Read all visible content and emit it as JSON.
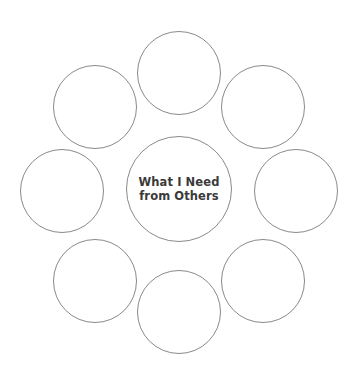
{
  "diagram": {
    "type": "cluster-web",
    "background_color": "#ffffff",
    "stroke_color": "#8a8a8a",
    "stroke_width_px": 1,
    "canvas": {
      "width": 355,
      "height": 376
    },
    "center": {
      "label": "What I Need\nfrom Others",
      "label_line_1": "What I Need",
      "label_line_2": "from Others",
      "text_color": "#3a3a3a",
      "cx": 179,
      "cy": 189,
      "diameter": 106
    },
    "petals": [
      {
        "name": "petal-top",
        "label": "",
        "cx": 179,
        "cy": 73,
        "diameter": 84
      },
      {
        "name": "petal-top-right",
        "label": "",
        "cx": 263,
        "cy": 107,
        "diameter": 84
      },
      {
        "name": "petal-right",
        "label": "",
        "cx": 296,
        "cy": 191,
        "diameter": 84
      },
      {
        "name": "petal-bottom-right",
        "label": "",
        "cx": 263,
        "cy": 281,
        "diameter": 84
      },
      {
        "name": "petal-bottom",
        "label": "",
        "cx": 179,
        "cy": 312,
        "diameter": 84
      },
      {
        "name": "petal-bottom-left",
        "label": "",
        "cx": 95,
        "cy": 281,
        "diameter": 84
      },
      {
        "name": "petal-left",
        "label": "",
        "cx": 62,
        "cy": 191,
        "diameter": 84
      },
      {
        "name": "petal-top-left",
        "label": "",
        "cx": 95,
        "cy": 107,
        "diameter": 84
      }
    ]
  }
}
